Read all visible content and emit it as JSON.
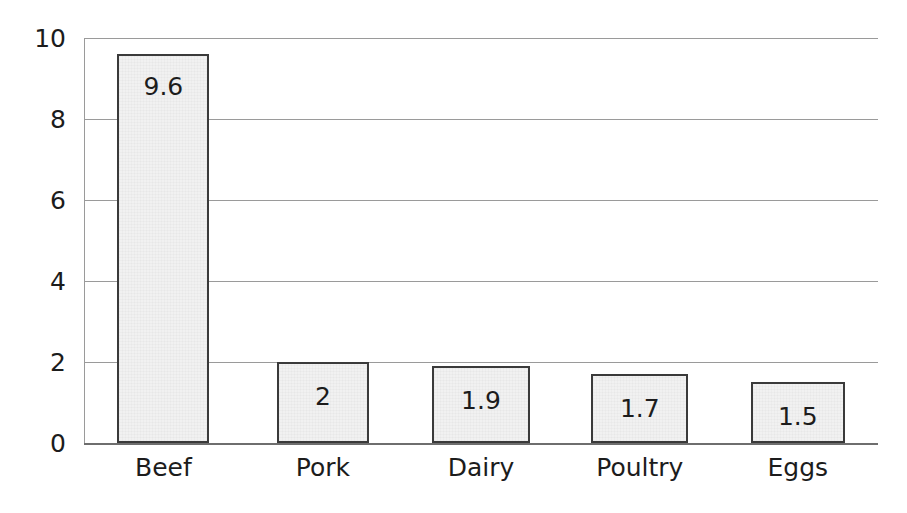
{
  "chart_data": {
    "type": "bar",
    "title": "",
    "subtitle": "",
    "xlabel": "",
    "ylabel": "",
    "categories": [
      "Beef",
      "Pork",
      "Dairy",
      "Poultry",
      "Eggs"
    ],
    "values": [
      9.6,
      2,
      1.9,
      1.7,
      1.5
    ],
    "value_labels": [
      "9.6",
      "2",
      "1.9",
      "1.7",
      "1.5"
    ],
    "ylim": [
      0,
      10
    ],
    "yticks": [
      0,
      2,
      4,
      6,
      8,
      10
    ],
    "ytick_labels": [
      "0",
      "2",
      "4",
      "6",
      "8",
      "10"
    ],
    "grid": true,
    "grid_axis": "y",
    "legend": false,
    "legend_position": "none",
    "bar_fill_color": "#f1f1f1",
    "bar_border_color": "#3a3a3a",
    "gridline_color": "#9a9a9a",
    "axis_color": "#6e6e6e",
    "text_color": "#1c1c1c",
    "background_color": "#ffffff",
    "bars": [
      {
        "category": "Beef",
        "value": 9.6,
        "label": "9.6",
        "x_pct": 4.2,
        "width_pct": 11.6
      },
      {
        "category": "Pork",
        "value": 2,
        "label": "2",
        "x_pct": 24.3,
        "width_pct": 11.6
      },
      {
        "category": "Dairy",
        "value": 1.9,
        "label": "1.9",
        "x_pct": 43.8,
        "width_pct": 12.4
      },
      {
        "category": "Poultry",
        "value": 1.7,
        "label": "1.7",
        "x_pct": 63.9,
        "width_pct": 12.2
      },
      {
        "category": "Eggs",
        "value": 1.5,
        "label": "1.5",
        "x_pct": 84.0,
        "width_pct": 11.8
      }
    ]
  }
}
